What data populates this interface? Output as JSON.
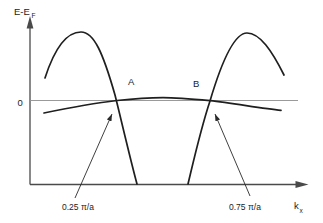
{
  "diagram": {
    "y_axis_label": {
      "main": "E-E",
      "sub": "F"
    },
    "x_axis_label": {
      "main": "k",
      "sub": "x"
    },
    "zero_label": "0",
    "crossing_points": [
      {
        "label": "A",
        "k_value": "0.25 π/a"
      },
      {
        "label": "B",
        "k_value": "0.75 π/a"
      }
    ],
    "colors": {
      "curve": "#1f1f1f",
      "axis": "#4a4a4a",
      "zero_line": "#9a9a9a",
      "annotation": "#2a2a2a",
      "text": "#1c1c1c",
      "background": "#ffffff"
    }
  }
}
